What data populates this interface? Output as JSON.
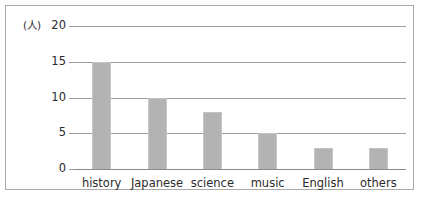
{
  "chart_data": {
    "type": "bar",
    "title": "",
    "xlabel": "",
    "ylabel": "(人)",
    "unit_label": "(人)",
    "categories": [
      "history",
      "Japanese",
      "science",
      "music",
      "English",
      "others"
    ],
    "values": [
      15,
      10,
      8,
      5,
      3,
      3
    ],
    "ylim": [
      0,
      20
    ],
    "yticks": [
      0,
      5,
      10,
      15,
      20
    ],
    "ytick_labels": [
      "0",
      "5",
      "10",
      "15",
      "20"
    ],
    "grid": true,
    "legend": false,
    "legend_position": "none",
    "bar_color": "#b3b3b3",
    "gridline_color": "#9d9d9d",
    "frame_color": "#a9a9a9",
    "text_color": "#2b2b2b"
  }
}
